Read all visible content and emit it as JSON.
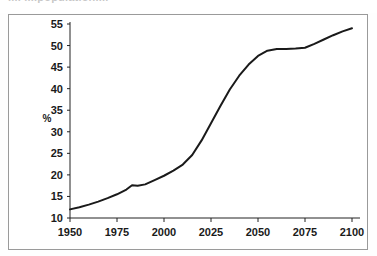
{
  "figure": {
    "title_partial": "....  ....population....",
    "frame_color": "#9a9a9a",
    "background": "#ffffff"
  },
  "chart_data": {
    "type": "line",
    "title": "",
    "xlabel": "",
    "ylabel": "%",
    "xlim": [
      1950,
      2100
    ],
    "ylim": [
      10,
      55
    ],
    "grid": false,
    "legend": "none",
    "line_color": "#1a1a1a",
    "xticks": [
      1950,
      1975,
      2000,
      2025,
      2050,
      2075,
      2100
    ],
    "xtick_labels": [
      "1950",
      "1975",
      "2000",
      "2025",
      "2050",
      "2075",
      "2100"
    ],
    "yticks": [
      10,
      15,
      20,
      25,
      30,
      35,
      40,
      45,
      50,
      55
    ],
    "ytick_labels": [
      "10",
      "15",
      "20",
      "25",
      "30",
      "35",
      "40",
      "45",
      "50",
      "55"
    ],
    "x": [
      1950,
      1955,
      1960,
      1965,
      1970,
      1975,
      1980,
      1983,
      1986,
      1990,
      1995,
      2000,
      2005,
      2010,
      2015,
      2020,
      2025,
      2030,
      2035,
      2040,
      2045,
      2050,
      2055,
      2060,
      2065,
      2070,
      2075,
      2080,
      2085,
      2090,
      2095,
      2100
    ],
    "y": [
      12.0,
      12.5,
      13.1,
      13.8,
      14.6,
      15.5,
      16.6,
      17.6,
      17.5,
      17.8,
      18.8,
      19.8,
      21.0,
      22.4,
      24.6,
      28.0,
      32.0,
      36.0,
      39.8,
      43.0,
      45.6,
      47.6,
      48.8,
      49.2,
      49.2,
      49.3,
      49.5,
      50.4,
      51.4,
      52.4,
      53.3,
      54.0
    ],
    "series": [
      {
        "name": "share",
        "values": [
          12.0,
          12.5,
          13.1,
          13.8,
          14.6,
          15.5,
          16.6,
          17.6,
          17.5,
          17.8,
          18.8,
          19.8,
          21.0,
          22.4,
          24.6,
          28.0,
          32.0,
          36.0,
          39.8,
          43.0,
          45.6,
          47.6,
          48.8,
          49.2,
          49.2,
          49.3,
          49.5,
          50.4,
          51.4,
          52.4,
          53.3,
          54.0
        ]
      }
    ]
  }
}
